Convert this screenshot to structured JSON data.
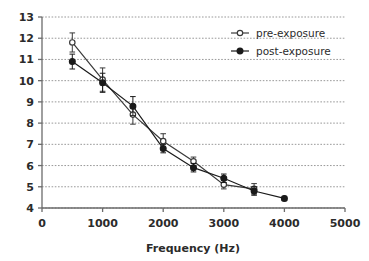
{
  "chart_data": {
    "type": "line",
    "title": "",
    "xlabel": "Frequency (Hz)",
    "ylabel": "",
    "xlim": [
      0,
      5000
    ],
    "ylim": [
      4,
      13
    ],
    "xticks": [
      0,
      1000,
      2000,
      3000,
      4000,
      5000
    ],
    "yticks": [
      4,
      5,
      6,
      7,
      8,
      9,
      10,
      11,
      12,
      13
    ],
    "xtick_labels": [
      "0",
      "1000",
      "2000",
      "3000",
      "4000",
      "5000"
    ],
    "ytick_labels": [
      "4",
      "5",
      "6",
      "7",
      "8",
      "9",
      "10",
      "11",
      "12",
      "13"
    ],
    "grid": {
      "horizontal": true,
      "vertical": false,
      "style": "dotted",
      "color": "#999999"
    },
    "legend": {
      "position": "top-right",
      "entries": [
        "pre-exposure",
        "post-exposure"
      ]
    },
    "series": [
      {
        "name": "pre-exposure",
        "marker": "open-circle",
        "color": "#3a3a3a",
        "x": [
          500,
          1000,
          1500,
          2000,
          2500,
          3000,
          3500
        ],
        "values": [
          11.8,
          10.05,
          8.4,
          7.15,
          6.2,
          5.1,
          4.9
        ],
        "yerr": [
          0.45,
          0.55,
          0.45,
          0.35,
          0.2,
          0.2,
          0.25
        ]
      },
      {
        "name": "post-exposure",
        "marker": "filled-circle",
        "color": "#1a1a1a",
        "x": [
          500,
          1000,
          1500,
          2000,
          2500,
          3000,
          3500,
          4000
        ],
        "values": [
          10.9,
          9.9,
          8.8,
          6.8,
          5.9,
          5.4,
          4.8,
          4.45
        ],
        "yerr": [
          0.35,
          0.45,
          0.45,
          0.2,
          0.2,
          0.2,
          0.2,
          0.1
        ]
      }
    ]
  },
  "legend": {
    "pre_label": "pre-exposure",
    "post_label": "post-exposure"
  },
  "axes": {
    "x_title": "Frequency (Hz)"
  }
}
